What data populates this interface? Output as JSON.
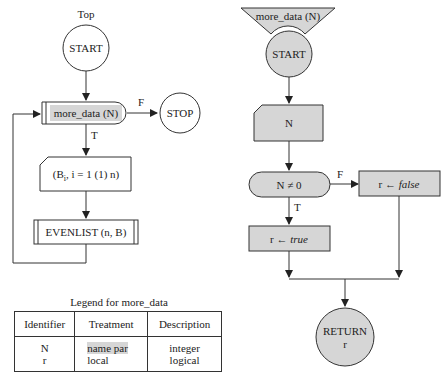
{
  "left_flowchart": {
    "title": "Top",
    "start": "START",
    "loop_call": "more_data (N)",
    "false_label": "F",
    "stop": "STOP",
    "true_label": "T",
    "input": "(Bi, i = 1 (1) n)",
    "input_parts": {
      "pre": "(B",
      "sub": "i",
      "post": ", i = 1 (1) n)"
    },
    "subroutine": "EVENLIST (n, B)"
  },
  "right_flowchart": {
    "header": "more_data (N)",
    "start": "START",
    "input": "N",
    "decision": "N ≠ 0",
    "false_label": "F",
    "true_label": "T",
    "false_assign": {
      "lhs": "r ← ",
      "value": "false"
    },
    "true_assign": {
      "lhs": "r ← ",
      "value": "true"
    },
    "return_line1": "RETURN",
    "return_line2": "r"
  },
  "legend": {
    "title": "Legend for more_data",
    "columns": [
      "Identifier",
      "Treatment",
      "Description"
    ],
    "rows": [
      {
        "identifier": "N",
        "treatment": "name par",
        "description": "integer"
      },
      {
        "identifier": "r",
        "treatment": "local",
        "description": "logical"
      }
    ]
  },
  "colors": {
    "fill_grey": "#d6d6d6",
    "stroke": "#333333"
  }
}
